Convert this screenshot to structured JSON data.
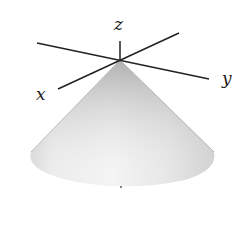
{
  "diagram": {
    "type": "3d-cone-with-axes",
    "axes": {
      "x_label": "x",
      "y_label": "y",
      "z_label": "z"
    },
    "colors": {
      "axis": "#222222",
      "cone_light": "#f2f2f2",
      "cone_dark": "#a8a8a8",
      "background": "#ffffff"
    }
  }
}
